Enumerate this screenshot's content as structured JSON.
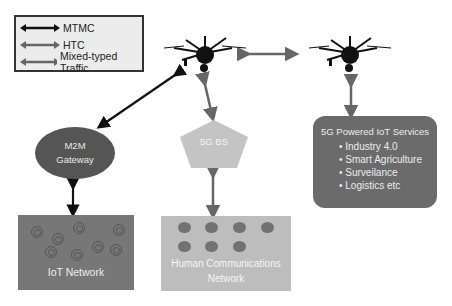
{
  "legend": {
    "items": [
      {
        "label": "MTMC",
        "color": "#111111"
      },
      {
        "label": "HTC",
        "color": "#666666"
      },
      {
        "label": "Mixed-typed Traffic",
        "color": "#666666"
      }
    ]
  },
  "nodes": {
    "drone_left": {
      "icon": "drone-icon"
    },
    "drone_right": {
      "icon": "drone-icon"
    },
    "m2m_gateway": {
      "line1": "M2M",
      "line2": "Gateway"
    },
    "base_station": {
      "label": "5G BS"
    },
    "services": {
      "title": "5G Powered IoT Services",
      "items": [
        "Industry 4.0",
        "Smart Agriculture",
        "Surveilance",
        "Logistics etc"
      ]
    },
    "iot_network": {
      "label": "IoT Network",
      "device_count": 8
    },
    "human_network": {
      "line1": "Human Communications",
      "line2": "Network",
      "user_count": 7
    }
  },
  "colors": {
    "mtmc_arrow": "#111111",
    "htc_arrow": "#666666",
    "gateway": "#555555",
    "base_station": "#c4c4c4",
    "services": "#6b6b6b",
    "iot_network": "#777777",
    "human_network": "#bdbdbd"
  }
}
